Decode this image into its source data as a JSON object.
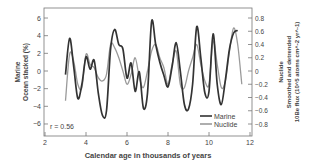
{
  "chart_data": {
    "type": "line",
    "title": "",
    "xlabel": "Calendar age in thousands of years",
    "ylabel_left": [
      "Marine",
      "Ocean stacked (%)"
    ],
    "ylabel_right": [
      "Nuclide",
      "Smoothed and detrended",
      "10Be flux (10^5 atoms cm^-2 yr^-1)"
    ],
    "xlim": [
      2,
      12
    ],
    "ylim_left": [
      -6.5,
      7
    ],
    "ylim_right": [
      -0.8,
      0.8
    ],
    "xticks": [
      2,
      4,
      6,
      8,
      10,
      12
    ],
    "yticks_left": [
      6,
      4,
      2,
      0,
      -2,
      -4,
      -6
    ],
    "yticks_right": [
      0.8,
      0.6,
      0.4,
      0.2,
      0,
      -0.2,
      -0.4,
      -0.6,
      -0.8
    ],
    "annotation": "r = 0.56",
    "legend": {
      "position": "lower right",
      "entries": [
        "Marine",
        "Nuclide"
      ]
    },
    "grid": false,
    "series": [
      {
        "name": "Marine",
        "axis": "left",
        "color": "#333333",
        "x": [
          3.0,
          3.2,
          3.4,
          3.6,
          3.8,
          4.0,
          4.2,
          4.4,
          4.6,
          4.8,
          5.0,
          5.2,
          5.4,
          5.6,
          5.8,
          6.0,
          6.2,
          6.4,
          6.6,
          6.8,
          7.0,
          7.2,
          7.4,
          7.6,
          7.8,
          8.0,
          8.2,
          8.4,
          8.6,
          8.8,
          9.0,
          9.2,
          9.4,
          9.6,
          9.8,
          10.0,
          10.2,
          10.4,
          10.6,
          10.8,
          11.0,
          11.2,
          11.4
        ],
        "values": [
          -0.4,
          3.7,
          0.5,
          -3.1,
          -1.5,
          1.6,
          0.2,
          1.2,
          -2.5,
          -5.0,
          -4.5,
          2.5,
          4.7,
          3.0,
          2.5,
          -0.8,
          0.9,
          -2.3,
          -0.1,
          -4.2,
          -2.5,
          5.6,
          3.0,
          1.0,
          -0.5,
          -1.8,
          0.5,
          3.2,
          0.0,
          -3.8,
          -4.3,
          -1.5,
          5.0,
          1.5,
          -2.5,
          -2.3,
          4.2,
          -1.5,
          -3.8,
          -1.0,
          2.5,
          4.3,
          4.6
        ]
      },
      {
        "name": "Nuclide",
        "axis": "right",
        "color": "#9a9a9a",
        "x": [
          3.0,
          3.2,
          3.4,
          3.6,
          3.8,
          4.0,
          4.2,
          4.4,
          4.6,
          4.8,
          5.0,
          5.2,
          5.4,
          5.6,
          5.8,
          6.0,
          6.2,
          6.4,
          6.6,
          6.8,
          7.0,
          7.2,
          7.4,
          7.6,
          7.8,
          8.0,
          8.2,
          8.4,
          8.6,
          8.8,
          9.0,
          9.2,
          9.4,
          9.6,
          9.8,
          10.0,
          10.2,
          10.4,
          10.6,
          10.8,
          11.0,
          11.2,
          11.4,
          11.6
        ],
        "values": [
          -0.45,
          0.25,
          0.15,
          -0.2,
          -0.25,
          0.25,
          0.1,
          0.05,
          -0.1,
          -0.15,
          -0.05,
          0.4,
          0.35,
          0.2,
          0.0,
          -0.2,
          -0.05,
          0.2,
          -0.1,
          -0.25,
          0.0,
          0.3,
          0.4,
          0.2,
          0.05,
          -0.2,
          0.1,
          0.3,
          -0.2,
          -0.25,
          0.0,
          0.2,
          0.4,
          0.1,
          -0.15,
          -0.2,
          0.45,
          0.1,
          -0.25,
          -0.15,
          0.3,
          0.65,
          0.4,
          -0.2
        ]
      }
    ]
  }
}
